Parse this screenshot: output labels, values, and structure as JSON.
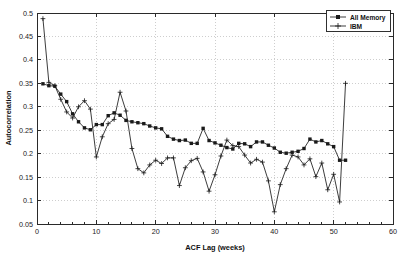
{
  "chart_data": {
    "type": "line",
    "title": "",
    "xlabel": "ACF Lag (weeks)",
    "ylabel": "Autocorrelation",
    "xlim": [
      0,
      60
    ],
    "ylim": [
      0.05,
      0.5
    ],
    "xticks": [
      0,
      10,
      20,
      30,
      40,
      50,
      60
    ],
    "xtick_labels": [
      "0",
      "10",
      "20",
      "30",
      "40",
      "50",
      "60"
    ],
    "yticks": [
      0.05,
      0.1,
      0.15,
      0.2,
      0.25,
      0.3,
      0.35,
      0.4,
      0.45,
      0.5
    ],
    "ytick_labels": [
      "0.05",
      "0.1",
      "0.15",
      "0.2",
      "0.25",
      "0.3",
      "0.35",
      "0.4",
      "0.45",
      "0.5"
    ],
    "grid": true,
    "grid_style": "dotted",
    "legend_position": "top-right",
    "legend_entries": [
      "All Memory",
      "IBM"
    ],
    "series": [
      {
        "name": "All Memory",
        "marker": "filled-square",
        "x": [
          1,
          2,
          3,
          4,
          5,
          6,
          7,
          8,
          9,
          10,
          11,
          12,
          13,
          14,
          15,
          16,
          17,
          18,
          19,
          20,
          21,
          22,
          23,
          24,
          25,
          26,
          27,
          28,
          29,
          30,
          31,
          32,
          33,
          34,
          35,
          36,
          37,
          38,
          39,
          40,
          41,
          42,
          43,
          44,
          45,
          46,
          47,
          48,
          49,
          50,
          51,
          52
        ],
        "values": [
          0.349,
          0.345,
          0.344,
          0.327,
          0.311,
          0.285,
          0.268,
          0.255,
          0.251,
          0.262,
          0.262,
          0.281,
          0.287,
          0.282,
          0.271,
          0.268,
          0.266,
          0.264,
          0.259,
          0.255,
          0.253,
          0.237,
          0.231,
          0.228,
          0.229,
          0.222,
          0.222,
          0.254,
          0.228,
          0.223,
          0.218,
          0.213,
          0.21,
          0.222,
          0.221,
          0.215,
          0.225,
          0.225,
          0.218,
          0.212,
          0.203,
          0.201,
          0.203,
          0.205,
          0.211,
          0.231,
          0.225,
          0.228,
          0.221,
          0.215,
          0.186,
          0.186
        ]
      },
      {
        "name": "IBM",
        "marker": "plus",
        "x": [
          1,
          2,
          3,
          4,
          5,
          6,
          7,
          8,
          9,
          10,
          11,
          12,
          13,
          14,
          15,
          16,
          17,
          18,
          19,
          20,
          21,
          22,
          23,
          24,
          25,
          26,
          27,
          28,
          29,
          30,
          31,
          32,
          33,
          34,
          35,
          36,
          37,
          38,
          39,
          40,
          41,
          42,
          43,
          44,
          45,
          46,
          47,
          48,
          49,
          50,
          51,
          52
        ],
        "values": [
          0.488,
          0.352,
          0.345,
          0.316,
          0.289,
          0.276,
          0.3,
          0.313,
          0.295,
          0.193,
          0.236,
          0.264,
          0.273,
          0.331,
          0.291,
          0.211,
          0.168,
          0.159,
          0.176,
          0.186,
          0.179,
          0.191,
          0.191,
          0.132,
          0.17,
          0.185,
          0.19,
          0.161,
          0.12,
          0.155,
          0.195,
          0.229,
          0.217,
          0.215,
          0.197,
          0.18,
          0.188,
          0.182,
          0.142,
          0.076,
          0.134,
          0.168,
          0.197,
          0.193,
          0.176,
          0.189,
          0.151,
          0.18,
          0.123,
          0.156,
          0.097,
          0.35
        ]
      }
    ]
  },
  "axes": {
    "ylabel_text": "Autocorrelation",
    "xlabel_text": "ACF Lag (weeks)"
  },
  "legend": {
    "items": [
      {
        "label": "All Memory",
        "marker": "filled-square"
      },
      {
        "label": "IBM",
        "marker": "plus"
      }
    ]
  }
}
